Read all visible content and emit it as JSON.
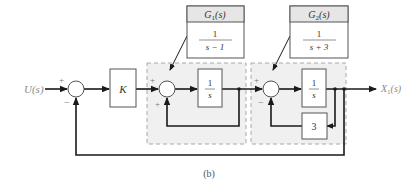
{
  "figure": {
    "caption": "(b)",
    "input_label": "U(s)",
    "output_label": "X",
    "output_label_sub": "1",
    "output_label_suffix": "(s)",
    "colors": {
      "line": "#1a1a1a",
      "block_fill": "#ffffff",
      "dashed_region_fill": "#f0f0f0",
      "dashed_border": "#a8a8a8",
      "header_fill": "#e6e6e6",
      "label_gray": "#8a8a8a"
    }
  },
  "summing_junctions": [
    {
      "id": "sum1",
      "top_sign": "+",
      "bottom_sign": "−"
    },
    {
      "id": "sum2",
      "top_sign": "+",
      "bottom_sign": "+"
    },
    {
      "id": "sum3",
      "top_sign": "+",
      "bottom_sign": "−"
    }
  ],
  "blocks": {
    "gain": {
      "label": "K"
    },
    "integrator1": {
      "numerator": "1",
      "denominator": "s"
    },
    "integrator2": {
      "numerator": "1",
      "denominator": "s"
    },
    "feedback_gain": {
      "label": "3"
    }
  },
  "callouts": {
    "g1": {
      "title": "G",
      "title_sub": "1",
      "title_suffix": "(s)",
      "numerator": "1",
      "denominator": "s − 1"
    },
    "g2": {
      "title": "G",
      "title_sub": "2",
      "title_suffix": "(s)",
      "numerator": "1",
      "denominator": "s + 3"
    }
  }
}
